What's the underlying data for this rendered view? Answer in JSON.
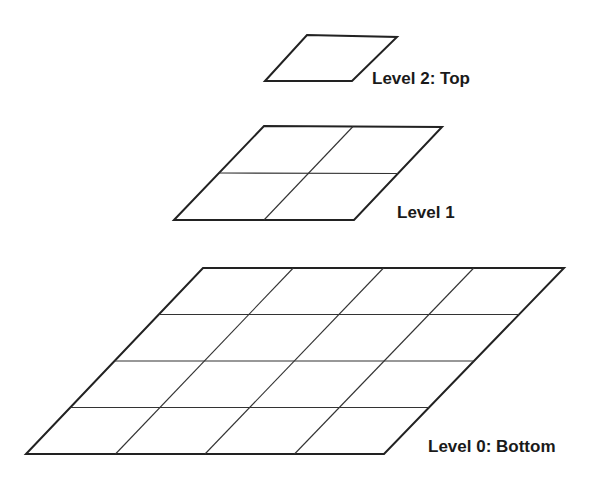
{
  "diagram": {
    "type": "image-pyramid",
    "levels": [
      {
        "id": 2,
        "label": "Level 2: Top",
        "grid": [
          1,
          1
        ]
      },
      {
        "id": 1,
        "label": "Level 1",
        "grid": [
          2,
          2
        ]
      },
      {
        "id": 0,
        "label": "Level 0: Bottom",
        "grid": [
          4,
          4
        ]
      }
    ]
  }
}
